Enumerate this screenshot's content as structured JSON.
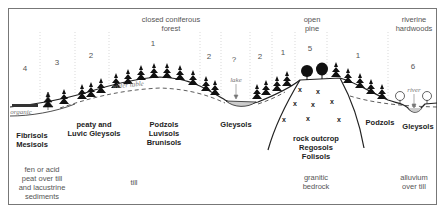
{
  "vegetation": {
    "closed_forest": "closed coniferous\nforest",
    "open_pine": "open\npine",
    "riverine": "riverine\nhardwoods"
  },
  "zones": [
    {
      "label": "4",
      "x": 20
    },
    {
      "label": "3",
      "x": 57
    },
    {
      "label": "2",
      "x": 91
    },
    {
      "label": "1",
      "x": 153
    },
    {
      "label": "2",
      "x": 209
    },
    {
      "label": "?",
      "x": 234
    },
    {
      "label": "2",
      "x": 260
    },
    {
      "label": "1",
      "x": 283
    },
    {
      "label": "5",
      "x": 310
    },
    {
      "label": "1",
      "x": 358
    },
    {
      "label": "6",
      "x": 413
    }
  ],
  "annotations": {
    "organic": "organic",
    "water_table": "water table",
    "lake": "lake",
    "river": "river"
  },
  "soils": {
    "fibrisols": "Fibrisols\nMesisols",
    "peaty": "peaty and\nLuvic Gleysols",
    "podzols_luvisols": "Podzols\nLuvisols\nBrunisols",
    "gleysols_lake": "Gleysols",
    "rock": "rock outcrop\nRegosols\nFolisols",
    "podzols": "Podzols",
    "gleysols_river": "Gleysols"
  },
  "parent_materials": {
    "fen": "fen or acid\npeat over till\nand lacustrine\nsediments",
    "till": "till",
    "granitic": "granitic\nbedrock",
    "alluvium": "alluvium\nover till"
  },
  "colors": {
    "line": "#222222",
    "divider": "#bbbbbb",
    "frame": "#777777"
  }
}
